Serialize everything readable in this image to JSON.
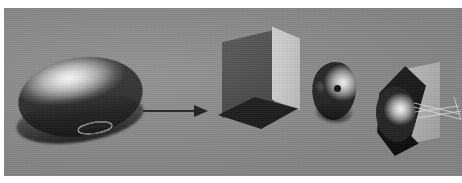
{
  "figure": {
    "caption": "",
    "domain_note": "grayscale 3D computer-graphics illustration strip",
    "panel": {
      "background_color": "#8b8b8b",
      "page_color": "#ffffff",
      "x": 4,
      "y": 8,
      "width": 458,
      "height": 168
    },
    "top_remnants": [
      {
        "left": 92,
        "width": 16
      },
      {
        "left": 118,
        "width": 10
      },
      {
        "left": 136,
        "width": 22
      },
      {
        "left": 166,
        "width": 12
      },
      {
        "left": 186,
        "width": 18
      },
      {
        "left": 212,
        "width": 9
      }
    ],
    "objects": [
      {
        "id": "ellipsoid",
        "name": "shaded-ellipsoid",
        "label": "",
        "description": "large smooth-shaded half ellipsoid with specular highlight and wireframe contour detail",
        "highlight_color": "#fdfdfd",
        "shadow_color": "#262626",
        "x": 18,
        "y": 52,
        "width": 125,
        "height": 92
      },
      {
        "id": "arrow",
        "name": "transformation-arrow",
        "label": "",
        "description": "horizontal right-pointing arrow indicating transformation",
        "color": "#1c1c1c",
        "x": 143,
        "y": 105,
        "width": 66,
        "height": 12
      },
      {
        "id": "box",
        "name": "rectangular-prism",
        "label": "",
        "description": "3D rectangular box, dark left face, light right face, dark diamond base",
        "left_face_color": "#4a4a4a",
        "right_face_color": "#cdcdcd",
        "base_color": "#141414",
        "x": 208,
        "y": 24,
        "width": 92,
        "height": 106
      },
      {
        "id": "blob",
        "name": "small-shaded-blob",
        "label": "",
        "description": "small shaded rounded object with dark notch and dark dot marker",
        "highlight_color": "#fbfbfb",
        "dot_color": "#0c0c0c",
        "x": 310,
        "y": 62,
        "width": 48,
        "height": 62
      },
      {
        "id": "wedge",
        "name": "dark-wedge-with-ellipsoid",
        "label": "",
        "description": "dark angular wedge enclosing a bright shaded ellipsoid, with light panel and faint wireframe lines at right",
        "wedge_color": "#111111",
        "panel_color": "#bdbdbd",
        "ellipsoid_highlight_color": "#ffffff",
        "x": 368,
        "y": 52,
        "width": 94,
        "height": 108
      }
    ],
    "wireframes": {
      "ellipsoid_contour_strokes": [
        {
          "x1": 2,
          "y1": 14,
          "x2": 22,
          "y2": 6
        },
        {
          "x1": 22,
          "y1": 6,
          "x2": 30,
          "y2": 16
        },
        {
          "x1": 6,
          "y1": 15,
          "x2": 34,
          "y2": 20
        },
        {
          "x1": 4,
          "y1": 20,
          "x2": 42,
          "y2": 19
        }
      ],
      "ellipsoid_ring": {
        "cx": 24,
        "cy": 20,
        "rx": 17,
        "ry": 5.5
      },
      "wedge_strokes": [
        {
          "x1": 0,
          "y1": 9,
          "x2": 46,
          "y2": 20
        },
        {
          "x1": 0,
          "y1": 13,
          "x2": 46,
          "y2": 25
        },
        {
          "x1": 1,
          "y1": 18,
          "x2": 45,
          "y2": 12
        },
        {
          "x1": 4,
          "y1": 24,
          "x2": 47,
          "y2": 17
        },
        {
          "x1": 40,
          "y1": 3,
          "x2": 47,
          "y2": 26
        }
      ]
    }
  }
}
